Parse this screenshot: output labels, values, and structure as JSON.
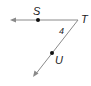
{
  "diagram": {
    "labels": {
      "S": "S",
      "T": "T",
      "U": "U",
      "angle": "4"
    },
    "colors": {
      "line": "#8a8a8a",
      "point": "#111111",
      "text": "#222222"
    }
  }
}
